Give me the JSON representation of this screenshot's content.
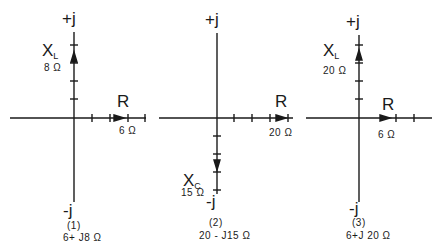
{
  "diagrams": [
    {
      "caption_number": "(1)",
      "impedance": "6+ J8 Ω",
      "pos_axis_label": "+j",
      "neg_axis_label": "-j",
      "reactance": {
        "symbol": "X",
        "subscript": "L",
        "value": "8 Ω",
        "direction": "up"
      },
      "resistance": {
        "symbol": "R",
        "value": "6 Ω"
      }
    },
    {
      "caption_number": "(2)",
      "impedance": "20 - J15 Ω",
      "pos_axis_label": "+j",
      "neg_axis_label": "-j",
      "reactance": {
        "symbol": "X",
        "subscript": "C",
        "value": "15 Ω",
        "direction": "down"
      },
      "resistance": {
        "symbol": "R",
        "value": "20 Ω"
      }
    },
    {
      "caption_number": "(3)",
      "impedance": "6+J 20 Ω",
      "pos_axis_label": "+j",
      "neg_axis_label": "-j",
      "reactance": {
        "symbol": "X",
        "subscript": "L",
        "value": "20 Ω",
        "direction": "up"
      },
      "resistance": {
        "symbol": "R",
        "value": "6 Ω"
      }
    }
  ],
  "colors": {
    "line": "#1a1a1a",
    "background": "#ffffff"
  }
}
